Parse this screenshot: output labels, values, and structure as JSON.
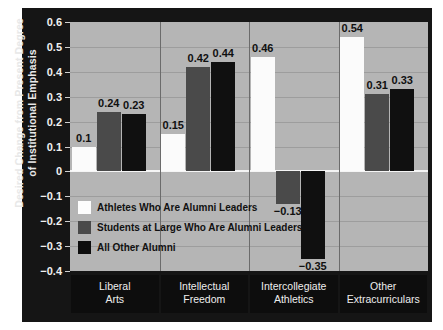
{
  "chart_data": {
    "type": "bar",
    "title": "",
    "xlabel": "",
    "ylabel": "Desired Change from Present Degree of Institutional Emphasis",
    "ylabel_lines": [
      "Desired Change from Present Degree",
      "of Institutional Emphasis"
    ],
    "categories": [
      "Liberal Arts",
      "Intellectual Freedom",
      "Intercollegiate Athletics",
      "Other Extracurriculars"
    ],
    "category_lines": [
      [
        "Liberal",
        "Arts"
      ],
      [
        "Intellectual",
        "Freedom"
      ],
      [
        "Intercollegiate",
        "Athletics"
      ],
      [
        "Other",
        "Extracurriculars"
      ]
    ],
    "series": [
      {
        "name": "Athletes Who Are Alumni Leaders",
        "color": "#fbfbfb",
        "values": [
          0.1,
          0.15,
          0.46,
          0.54
        ],
        "labels": [
          "0.1",
          "0.15",
          "0.46",
          "0.54"
        ]
      },
      {
        "name": "Students at Large Who Are Alumni Leaders",
        "color": "#4a4a4a",
        "values": [
          0.24,
          0.42,
          -0.13,
          0.31
        ],
        "labels": [
          "0.24",
          "0.42",
          "−0.13",
          "0.31"
        ]
      },
      {
        "name": "All Other Alumni",
        "color": "#101010",
        "values": [
          0.23,
          0.44,
          -0.35,
          0.33
        ],
        "labels": [
          "0.23",
          "0.44",
          "−0.35",
          "0.33"
        ]
      }
    ],
    "ylim": [
      -0.4,
      0.6
    ],
    "ytick_values": [
      0.6,
      0.5,
      0.4,
      0.3,
      0.2,
      0.1,
      0,
      -0.1,
      -0.2,
      -0.3,
      -0.4
    ],
    "ytick_labels": [
      "0.6",
      "0.5",
      "0.4",
      "0.3",
      "0.2",
      "0.1",
      "0",
      "−0.1",
      "−0.2",
      "−0.3",
      "−0.4"
    ],
    "grid": true,
    "legend_position": "inside-lower-left",
    "plot_background": "#b5b5b5",
    "panel_background": "#151515",
    "zero_line_color": "#f5f5f5"
  }
}
